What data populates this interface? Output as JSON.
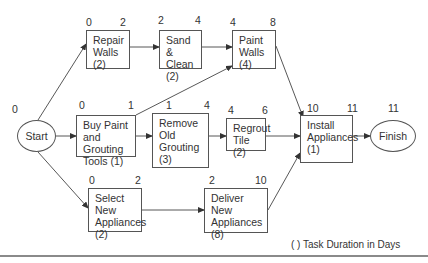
{
  "diagram": {
    "title": "",
    "legend": "( ) Task Duration in Days",
    "nodes": {
      "start": {
        "label": "Start",
        "time": "0"
      },
      "finish": {
        "label": "Finish",
        "time": "11"
      },
      "repair_walls": {
        "label": "Repair\nWalls\n(2)",
        "es": "0",
        "ef": "2"
      },
      "sand_clean": {
        "label": "Sand &\nClean\n(2)",
        "es": "2",
        "ef": "4"
      },
      "paint_walls": {
        "label": "Paint\nWalls\n(4)",
        "es": "4",
        "ef": "8"
      },
      "buy_paint": {
        "label": "Buy Paint\nand Grouting\nTools  (1)",
        "es": "0",
        "ef": "1"
      },
      "remove_grouting": {
        "label": "Remove\nOld\nGrouting\n(3)",
        "es": "1",
        "ef": "4"
      },
      "regrout_tile": {
        "label": "Regrout\nTile (2)",
        "es": "4",
        "ef": "6"
      },
      "install_appliances": {
        "label": "Install\nAppliances\n(1)",
        "es": "10",
        "ef": "11"
      },
      "select_appliances": {
        "label": "Select New\nAppliances\n(2)",
        "es": "0",
        "ef": "2"
      },
      "deliver_appliances": {
        "label": "Deliver New\nAppliances\n(8)",
        "es": "2",
        "ef": "10"
      }
    },
    "edges": [
      [
        "start",
        "repair_walls"
      ],
      [
        "start",
        "buy_paint"
      ],
      [
        "start",
        "select_appliances"
      ],
      [
        "repair_walls",
        "sand_clean"
      ],
      [
        "sand_clean",
        "paint_walls"
      ],
      [
        "buy_paint",
        "paint_walls"
      ],
      [
        "buy_paint",
        "remove_grouting"
      ],
      [
        "remove_grouting",
        "regrout_tile"
      ],
      [
        "paint_walls",
        "install_appliances"
      ],
      [
        "regrout_tile",
        "install_appliances"
      ],
      [
        "select_appliances",
        "deliver_appliances"
      ],
      [
        "deliver_appliances",
        "install_appliances"
      ],
      [
        "install_appliances",
        "finish"
      ]
    ]
  }
}
